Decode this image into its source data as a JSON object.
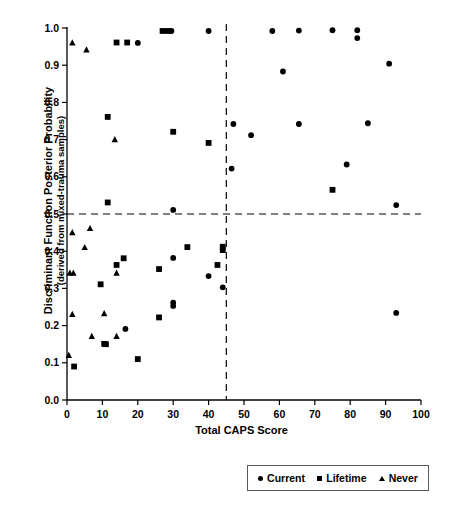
{
  "chart_data": {
    "type": "scatter",
    "title": "",
    "xlabel": "Total CAPS Score",
    "ylabel": "Discriminant Function Posterior Probability",
    "ylabel_sub": "(derived from mixed-trauma samples)",
    "xlim": [
      0,
      100
    ],
    "ylim": [
      0.0,
      1.0
    ],
    "xticks": [
      "0",
      "10",
      "20",
      "30",
      "40",
      "50",
      "60",
      "70",
      "80",
      "90",
      "100"
    ],
    "xtick_values": [
      0,
      10,
      20,
      30,
      40,
      50,
      60,
      70,
      80,
      90,
      100
    ],
    "yticks": [
      "0.0",
      "0.1",
      "0.2",
      "0.3",
      "0.4",
      "0.5",
      "0.6",
      "0.7",
      "0.8",
      "0.9",
      "1.0"
    ],
    "ytick_values": [
      0.0,
      0.1,
      0.2,
      0.3,
      0.4,
      0.5,
      0.6,
      0.7,
      0.8,
      0.9,
      1.0
    ],
    "grid": false,
    "legend_position": "bottom-right",
    "reference_lines": [
      {
        "name": "probability-cutoff",
        "orientation": "horizontal",
        "value": 0.5,
        "style": "dashed",
        "color": "#000000"
      },
      {
        "name": "caps-cutoff",
        "orientation": "vertical",
        "value": 45,
        "style": "dashed",
        "color": "#000000"
      }
    ],
    "marker_color": "#000000",
    "series": [
      {
        "name": "Current",
        "marker": "circle",
        "points": [
          [
            20.0,
            0.96
          ],
          [
            29.5,
            0.992
          ],
          [
            40.0,
            0.992
          ],
          [
            58.0,
            0.992
          ],
          [
            65.5,
            0.993
          ],
          [
            75.0,
            0.994
          ],
          [
            82.0,
            0.994
          ],
          [
            82.0,
            0.973
          ],
          [
            91.0,
            0.904
          ],
          [
            61.0,
            0.883
          ],
          [
            47.0,
            0.742
          ],
          [
            65.5,
            0.742
          ],
          [
            85.0,
            0.744
          ],
          [
            52.0,
            0.712
          ],
          [
            79.0,
            0.633
          ],
          [
            46.5,
            0.622
          ],
          [
            30.0,
            0.511
          ],
          [
            93.0,
            0.524
          ],
          [
            30.0,
            0.382
          ],
          [
            40.0,
            0.333
          ],
          [
            44.0,
            0.303
          ],
          [
            30.0,
            0.262
          ],
          [
            30.0,
            0.253
          ],
          [
            93.0,
            0.234
          ],
          [
            16.5,
            0.191
          ]
        ]
      },
      {
        "name": "Lifetime",
        "marker": "square",
        "points": [
          [
            27.0,
            0.992
          ],
          [
            28.5,
            0.992
          ],
          [
            14.0,
            0.961
          ],
          [
            17.0,
            0.961
          ],
          [
            11.5,
            0.761
          ],
          [
            30.0,
            0.721
          ],
          [
            40.0,
            0.691
          ],
          [
            11.5,
            0.531
          ],
          [
            75.0,
            0.565
          ],
          [
            34.0,
            0.411
          ],
          [
            44.0,
            0.412
          ],
          [
            44.0,
            0.403
          ],
          [
            16.0,
            0.381
          ],
          [
            14.0,
            0.363
          ],
          [
            42.5,
            0.363
          ],
          [
            26.0,
            0.352
          ],
          [
            9.5,
            0.311
          ],
          [
            26.0,
            0.222
          ],
          [
            10.5,
            0.151
          ],
          [
            11.0,
            0.15
          ],
          [
            20.0,
            0.11
          ],
          [
            2.0,
            0.09
          ]
        ]
      },
      {
        "name": "Never",
        "marker": "triangle",
        "points": [
          [
            1.5,
            0.96
          ],
          [
            5.5,
            0.941
          ],
          [
            13.5,
            0.7
          ],
          [
            6.5,
            0.461
          ],
          [
            1.5,
            0.45
          ],
          [
            5.0,
            0.41
          ],
          [
            0.8,
            0.341
          ],
          [
            1.8,
            0.341
          ],
          [
            14.0,
            0.341
          ],
          [
            1.5,
            0.23
          ],
          [
            10.5,
            0.232
          ],
          [
            7.0,
            0.171
          ],
          [
            14.0,
            0.171
          ],
          [
            0.5,
            0.12
          ]
        ]
      }
    ]
  },
  "legend": {
    "items": [
      {
        "label": "Current",
        "marker": "circle"
      },
      {
        "label": "Lifetime",
        "marker": "square"
      },
      {
        "label": "Never",
        "marker": "triangle"
      }
    ]
  }
}
